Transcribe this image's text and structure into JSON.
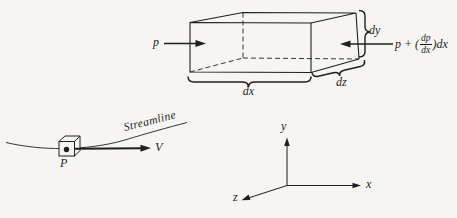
{
  "figure": {
    "colors": {
      "ink": "#1f1f1f",
      "background": "#f6f5f2"
    },
    "fluid_element": {
      "pressure_left": "p",
      "pressure_right_prefix": "p + (",
      "pressure_right_numerator": "dp",
      "pressure_right_denominator": "dx",
      "pressure_right_suffix": ")dx",
      "width_label": "dx",
      "height_label": "dy",
      "depth_label": "dz"
    },
    "streamline": {
      "curve_label": "Streamline",
      "velocity_label": "V",
      "point_label": "P"
    },
    "axes": {
      "x_label": "x",
      "y_label": "y",
      "z_label": "z"
    }
  }
}
